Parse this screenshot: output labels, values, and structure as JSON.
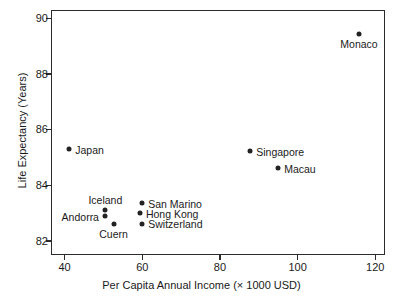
{
  "chart_data": {
    "type": "scatter",
    "title": "",
    "xlabel": "Per Capita Annual Income (× 1000 USD)",
    "ylabel": "Life Expectancy (Years)",
    "xlim": [
      36.5,
      122.5
    ],
    "ylim": [
      81.5,
      90.3
    ],
    "xticks": [
      40,
      60,
      80,
      100,
      120
    ],
    "xticklabels": [
      "40",
      "60",
      "80",
      "100",
      "120"
    ],
    "yticks": [
      82,
      84,
      86,
      88,
      90
    ],
    "yticklabels": [
      "82",
      "84",
      "86",
      "88",
      "90"
    ],
    "grid": false,
    "legend": false,
    "marker": "filled-circle",
    "marker_color": "#222222",
    "points": [
      {
        "label": "Japan",
        "x": 41.2,
        "y": 85.3,
        "label_pos": "right"
      },
      {
        "label": "Iceland",
        "x": 50.5,
        "y": 83.1,
        "label_pos": "above"
      },
      {
        "label": "Andorra",
        "x": 50.4,
        "y": 82.9,
        "label_pos": "left"
      },
      {
        "label": "Cuern",
        "x": 52.6,
        "y": 82.6,
        "label_pos": "below"
      },
      {
        "label": "San Marino",
        "x": 60.0,
        "y": 83.35,
        "label_pos": "right"
      },
      {
        "label": "Hong Kong",
        "x": 59.4,
        "y": 83.0,
        "label_pos": "right"
      },
      {
        "label": "Switzerland",
        "x": 60.0,
        "y": 82.62,
        "label_pos": "right"
      },
      {
        "label": "Singapore",
        "x": 87.8,
        "y": 85.22,
        "label_pos": "right"
      },
      {
        "label": "Macau",
        "x": 95.0,
        "y": 84.62,
        "label_pos": "right"
      },
      {
        "label": "Monaco",
        "x": 115.8,
        "y": 89.45,
        "label_pos": "below"
      }
    ]
  }
}
